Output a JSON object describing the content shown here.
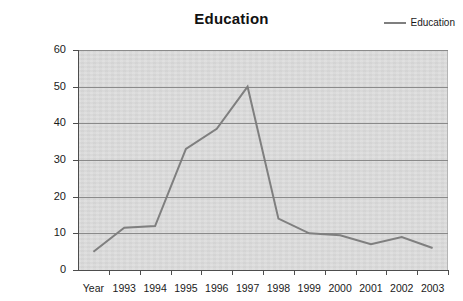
{
  "chart_data": {
    "type": "line",
    "title": "Education",
    "xlabel": "",
    "ylabel": "",
    "categories": [
      "Year",
      "1993",
      "1994",
      "1995",
      "1996",
      "1997",
      "1998",
      "1999",
      "2000",
      "2001",
      "2002",
      "2003"
    ],
    "series": [
      {
        "name": "Education",
        "values": [
          5,
          11.5,
          12,
          33,
          38.5,
          50,
          14,
          10,
          9.5,
          7,
          9,
          6
        ]
      }
    ],
    "ylim": [
      0,
      60
    ],
    "y_ticks": [
      0,
      10,
      20,
      30,
      40,
      50,
      60
    ],
    "y_tick_labels": [
      "0",
      "10",
      "20",
      "30",
      "40",
      "50",
      "60"
    ],
    "grid": true,
    "grid_axis": "y",
    "legend_position": "top-right",
    "plot_background": "#d9d9d9",
    "line_color": "#7f7f7f",
    "figure_background": "#ffffff"
  },
  "legend": {
    "entries": [
      {
        "label": "Education"
      }
    ]
  }
}
